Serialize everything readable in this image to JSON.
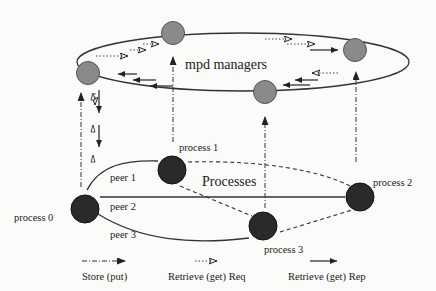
{
  "diagram": {
    "ring_label": "mpd managers",
    "processes_label": "Processes",
    "processes": [
      {
        "id": 0,
        "label": "process 0"
      },
      {
        "id": 1,
        "label": "process 1"
      },
      {
        "id": 2,
        "label": "process 2"
      },
      {
        "id": 3,
        "label": "process 3"
      }
    ],
    "peers": [
      {
        "label": "peer 1"
      },
      {
        "label": "peer 2"
      },
      {
        "label": "peer 3"
      }
    ],
    "managers_count": 4,
    "legend": [
      {
        "style": "dash-dot arrow",
        "label": "Store (put)"
      },
      {
        "style": "dotted open arrow",
        "label": "Retrieve (get) Req"
      },
      {
        "style": "solid arrow",
        "label": "Retrieve (get) Rep"
      }
    ],
    "colors": {
      "manager_fill": "#8a8a8a",
      "process_fill": "#2a2a2a",
      "line": "#333333",
      "background": "#fbfbf9"
    }
  }
}
